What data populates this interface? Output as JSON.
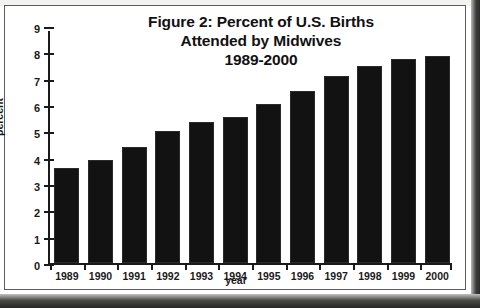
{
  "figure": {
    "title_lines": [
      "Figure 2: Percent of U.S. Births",
      "Attended by Midwives",
      "1989-2000"
    ]
  },
  "axes": {
    "y_title": "percent",
    "x_title": "year",
    "y_ticks": [
      "0",
      "1",
      "2",
      "3",
      "4",
      "5",
      "6",
      "7",
      "8",
      "9"
    ],
    "x_ticks": [
      "1989",
      "1990",
      "1991",
      "1992",
      "1993",
      "1994",
      "1995",
      "1996",
      "1997",
      "1998",
      "1999",
      "2000"
    ]
  },
  "colors": {
    "bar": "#121212",
    "axis": "#1a1a1a",
    "plate_background": "#ffffff",
    "plate_border": "#5c5c5a",
    "scan_shadow": "#2c2c2a"
  },
  "chart_data": {
    "type": "bar",
    "title": "Figure 2: Percent of U.S. Births Attended by Midwives 1989-2000",
    "xlabel": "year",
    "ylabel": "percent",
    "categories": [
      "1989",
      "1990",
      "1991",
      "1992",
      "1993",
      "1994",
      "1995",
      "1996",
      "1997",
      "1998",
      "1999",
      "2000"
    ],
    "values": [
      3.6,
      3.9,
      4.4,
      5.0,
      5.35,
      5.55,
      6.05,
      6.55,
      7.1,
      7.5,
      7.75,
      7.85
    ],
    "ylim": [
      0,
      9
    ],
    "ytick_step": 1,
    "grid": false,
    "legend": false,
    "series_name": "Percent of U.S. births attended by midwives"
  }
}
